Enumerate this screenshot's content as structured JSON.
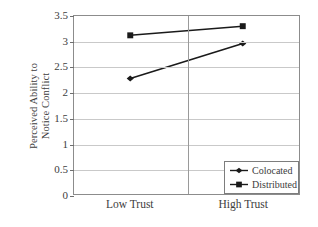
{
  "chart_data": {
    "type": "line",
    "title": "",
    "xlabel": "",
    "ylabel": "Perceived Ability to Notice Conflict",
    "ylabel_lines": [
      "Perceived Ability to",
      "Notice Conflict"
    ],
    "categories": [
      "Low Trust",
      "High Trust"
    ],
    "series": [
      {
        "name": "Colocated",
        "marker": "diamond",
        "values": [
          2.27,
          2.96
        ]
      },
      {
        "name": "Distributed",
        "marker": "square",
        "values": [
          3.12,
          3.3
        ]
      }
    ],
    "ylim": [
      0,
      3.5
    ],
    "yticks": [
      0,
      0.5,
      1,
      1.5,
      2,
      2.5,
      3,
      3.5
    ],
    "ytick_labels": [
      "0",
      "0.5",
      "1",
      "1.5",
      "2",
      "2.5",
      "3",
      "3.5"
    ],
    "grid": "horizontal",
    "legend_position": "lower-right",
    "colors": {
      "series_line": "#1a1a1a",
      "gridline": "#c9c9c9",
      "axis": "#8c8c8c",
      "text": "#3d3d3d",
      "background": "#ffffff"
    }
  },
  "legend": {
    "entries": [
      {
        "label": "Colocated",
        "marker": "diamond"
      },
      {
        "label": "Distributed",
        "marker": "square"
      }
    ]
  }
}
